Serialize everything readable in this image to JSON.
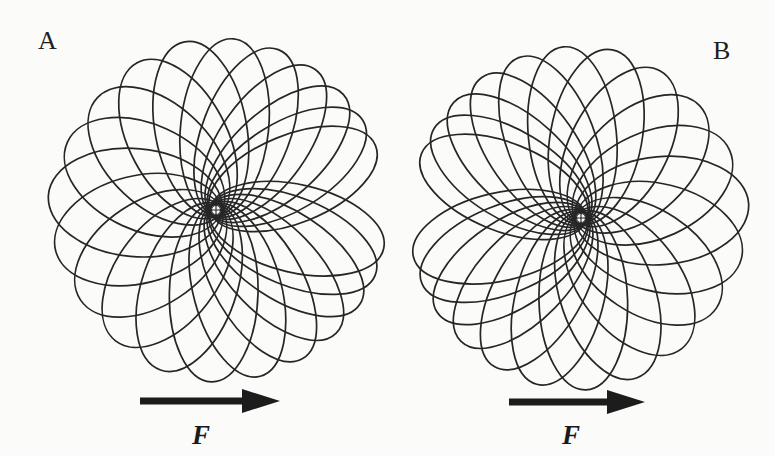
{
  "figure": {
    "panels": [
      {
        "id": "A",
        "label": "A",
        "label_pos": [
          38,
          28
        ],
        "focus": [
          216,
          210
        ],
        "mirror": false,
        "force": {
          "label": "F",
          "direction": "right",
          "arrow_from": [
            140,
            401
          ],
          "arrow_to": [
            280,
            401
          ],
          "label_pos": [
            192,
            422
          ]
        }
      },
      {
        "id": "B",
        "label": "B",
        "label_pos": [
          713,
          38
        ],
        "focus": [
          581,
          218
        ],
        "mirror": true,
        "force": {
          "label": "F",
          "direction": "right",
          "arrow_from": [
            509,
            402
          ],
          "arrow_to": [
            645,
            402
          ],
          "label_pos": [
            562,
            422
          ]
        }
      }
    ],
    "orbit": {
      "description": "Precessing Kepler ellipses sharing a common focus (marked with ⊕)",
      "count": 22,
      "focus_symbol": "⊕",
      "stroke_color": "#262626"
    },
    "colors": {
      "background": "#fbfbf9",
      "ink": "#222222"
    }
  }
}
